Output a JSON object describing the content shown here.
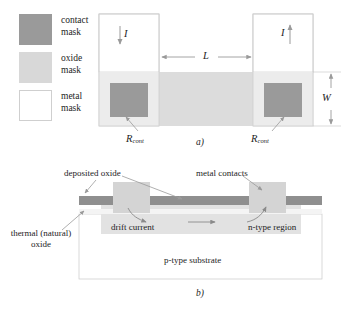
{
  "figure": {
    "legend": {
      "items": [
        {
          "label_line1": "contact",
          "label_line2": "mask",
          "name": "contact-mask",
          "color": "#9a9a9a"
        },
        {
          "label_line1": "oxide",
          "label_line2": "mask",
          "name": "oxide-mask",
          "color": "#d8d8d8"
        },
        {
          "label_line1": "metal",
          "label_line2": "mask",
          "name": "metal-mask",
          "color": "#ffffff"
        }
      ]
    },
    "top_view": {
      "caption": "a)",
      "current_left_label": "I",
      "current_right_label": "I",
      "length_label": "L",
      "width_label": "W",
      "contact_resistance_left": "R",
      "contact_resistance_left_sub": "cont",
      "contact_resistance_right": "R",
      "contact_resistance_right_sub": "cont"
    },
    "cross_section": {
      "caption": "b)",
      "deposited_oxide_label": "deposited oxide",
      "metal_contacts_label": "metal contacts",
      "thermal_oxide_line1": "thermal (natural)",
      "thermal_oxide_line2": "oxide",
      "drift_current_label": "drift current",
      "n_type_region_italic": "n",
      "n_type_region_rest": "-type region",
      "p_type_substrate_italic": "p",
      "p_type_substrate_rest": "-type substrate"
    },
    "colors": {
      "contact_gray": "#9a9a9a",
      "oxide_gray": "#d8d8d8",
      "deposited_oxide_dark": "#8f8f8f",
      "metal_white": "#ffffff",
      "substrate_white": "#ffffff",
      "outline": "#b9b9b9",
      "arrow": "#6e6e6e",
      "text": "#1d1d1d"
    }
  }
}
